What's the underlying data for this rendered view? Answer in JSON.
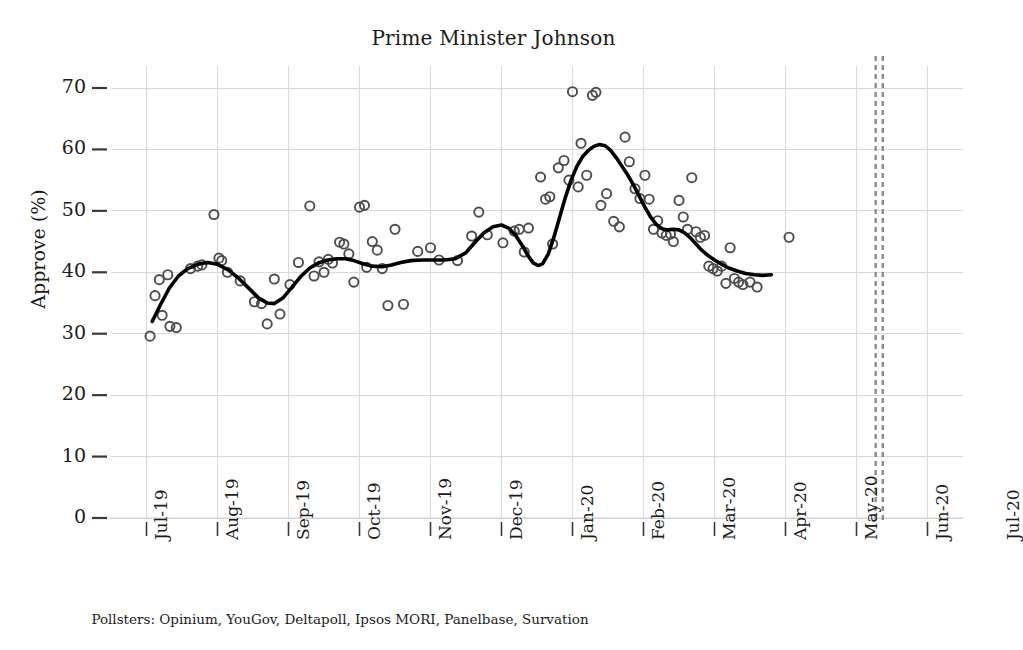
{
  "chart_data": {
    "type": "scatter",
    "title": "Prime Minister Johnson",
    "xlabel": "",
    "ylabel": "Approve (%)",
    "ylim": [
      0,
      73
    ],
    "yticks": [
      0,
      10,
      20,
      30,
      40,
      50,
      60,
      70
    ],
    "ytick_labels": [
      "0",
      "10",
      "20",
      "30",
      "40",
      "50",
      "60",
      "70"
    ],
    "xlim": [
      "2019-07-01",
      "2020-07-15"
    ],
    "xtick_labels": [
      "Jul-19",
      "Aug-19",
      "Sep-19",
      "Oct-19",
      "Nov-19",
      "Dec-19",
      "Jan-20",
      "Feb-20",
      "Mar-20",
      "Apr-20",
      "May-20",
      "Jun-20",
      "Jul-20"
    ],
    "grid": true,
    "legend": null,
    "caption": "Pollsters: Opinium, YouGov, Deltapoll, Ipsos MORI, Panelbase, Survation",
    "marker": "open-circle",
    "marker_color": "#4d4d4d",
    "line_color": "#000000",
    "grid_color": "#d9d9d9",
    "annotations": [
      {
        "type": "vline",
        "style": "dashed",
        "color": "#8c8c8c",
        "x": 11.27,
        "label": ""
      },
      {
        "type": "vline",
        "style": "dashed",
        "color": "#8c8c8c",
        "x": 11.37,
        "label": ""
      }
    ],
    "series": [
      {
        "name": "Poll approval",
        "type": "scatter",
        "points": [
          [
            1.05,
            29.6
          ],
          [
            1.12,
            36.2
          ],
          [
            1.18,
            38.8
          ],
          [
            1.22,
            33.0
          ],
          [
            1.3,
            39.6
          ],
          [
            1.33,
            31.2
          ],
          [
            1.42,
            31.0
          ],
          [
            1.62,
            40.6
          ],
          [
            1.72,
            41.0
          ],
          [
            1.78,
            41.2
          ],
          [
            1.95,
            49.4
          ],
          [
            2.02,
            42.3
          ],
          [
            2.06,
            41.9
          ],
          [
            2.14,
            40.0
          ],
          [
            2.32,
            38.6
          ],
          [
            2.52,
            35.2
          ],
          [
            2.62,
            34.9
          ],
          [
            2.7,
            31.6
          ],
          [
            2.8,
            38.9
          ],
          [
            2.88,
            33.2
          ],
          [
            3.02,
            38.0
          ],
          [
            3.14,
            41.6
          ],
          [
            3.3,
            50.8
          ],
          [
            3.36,
            39.4
          ],
          [
            3.43,
            41.7
          ],
          [
            3.5,
            40.0
          ],
          [
            3.56,
            42.1
          ],
          [
            3.62,
            41.5
          ],
          [
            3.72,
            44.9
          ],
          [
            3.78,
            44.6
          ],
          [
            3.85,
            43.0
          ],
          [
            3.92,
            38.4
          ],
          [
            4.0,
            50.6
          ],
          [
            4.07,
            50.9
          ],
          [
            4.1,
            40.8
          ],
          [
            4.18,
            45.0
          ],
          [
            4.25,
            43.6
          ],
          [
            4.32,
            40.6
          ],
          [
            4.4,
            34.6
          ],
          [
            4.5,
            47.0
          ],
          [
            4.62,
            34.8
          ],
          [
            4.82,
            43.4
          ],
          [
            5.0,
            44.0
          ],
          [
            5.12,
            42.0
          ],
          [
            5.38,
            41.9
          ],
          [
            5.58,
            45.9
          ],
          [
            5.68,
            49.8
          ],
          [
            5.8,
            46.1
          ],
          [
            6.02,
            44.8
          ],
          [
            6.18,
            46.7
          ],
          [
            6.25,
            47.0
          ],
          [
            6.32,
            43.3
          ],
          [
            6.38,
            47.2
          ],
          [
            6.55,
            55.5
          ],
          [
            6.62,
            51.9
          ],
          [
            6.68,
            52.3
          ],
          [
            6.72,
            44.6
          ],
          [
            6.8,
            57.0
          ],
          [
            6.88,
            58.2
          ],
          [
            6.95,
            55.0
          ],
          [
            7.0,
            69.4
          ],
          [
            7.08,
            53.9
          ],
          [
            7.12,
            61.0
          ],
          [
            7.2,
            55.8
          ],
          [
            7.28,
            68.8
          ],
          [
            7.33,
            69.3
          ],
          [
            7.4,
            50.9
          ],
          [
            7.48,
            52.8
          ],
          [
            7.58,
            48.3
          ],
          [
            7.66,
            47.4
          ],
          [
            7.74,
            62.0
          ],
          [
            7.8,
            58.0
          ],
          [
            7.88,
            53.6
          ],
          [
            7.95,
            52.0
          ],
          [
            8.02,
            55.8
          ],
          [
            8.08,
            51.9
          ],
          [
            8.14,
            47.0
          ],
          [
            8.2,
            48.4
          ],
          [
            8.26,
            46.4
          ],
          [
            8.32,
            46.0
          ],
          [
            8.38,
            46.2
          ],
          [
            8.42,
            45.0
          ],
          [
            8.5,
            51.7
          ],
          [
            8.56,
            49.0
          ],
          [
            8.62,
            47.0
          ],
          [
            8.68,
            55.4
          ],
          [
            8.74,
            46.6
          ],
          [
            8.8,
            45.7
          ],
          [
            8.86,
            46.0
          ],
          [
            8.92,
            41.0
          ],
          [
            8.98,
            40.6
          ],
          [
            9.04,
            40.2
          ],
          [
            9.1,
            41.0
          ],
          [
            9.16,
            38.2
          ],
          [
            9.22,
            44.0
          ],
          [
            9.28,
            39.0
          ],
          [
            9.34,
            38.4
          ],
          [
            9.4,
            38.0
          ],
          [
            9.5,
            38.4
          ],
          [
            9.6,
            37.6
          ],
          [
            10.05,
            45.7
          ]
        ]
      },
      {
        "name": "Smoothed trend",
        "type": "line",
        "points": [
          [
            1.08,
            32.0
          ],
          [
            1.2,
            34.8
          ],
          [
            1.32,
            37.4
          ],
          [
            1.45,
            39.4
          ],
          [
            1.58,
            40.6
          ],
          [
            1.72,
            41.3
          ],
          [
            1.86,
            41.6
          ],
          [
            2.0,
            41.3
          ],
          [
            2.15,
            40.4
          ],
          [
            2.3,
            39.0
          ],
          [
            2.45,
            37.3
          ],
          [
            2.58,
            35.8
          ],
          [
            2.7,
            35.0
          ],
          [
            2.8,
            34.9
          ],
          [
            2.92,
            35.8
          ],
          [
            3.05,
            37.6
          ],
          [
            3.18,
            39.4
          ],
          [
            3.3,
            40.7
          ],
          [
            3.42,
            41.5
          ],
          [
            3.55,
            42.0
          ],
          [
            3.68,
            42.2
          ],
          [
            3.8,
            42.2
          ],
          [
            3.92,
            41.9
          ],
          [
            4.05,
            41.4
          ],
          [
            4.18,
            41.0
          ],
          [
            4.32,
            40.9
          ],
          [
            4.45,
            41.2
          ],
          [
            4.58,
            41.6
          ],
          [
            4.72,
            41.9
          ],
          [
            4.88,
            42.0
          ],
          [
            5.05,
            42.0
          ],
          [
            5.2,
            42.0
          ],
          [
            5.35,
            42.2
          ],
          [
            5.5,
            43.2
          ],
          [
            5.62,
            44.8
          ],
          [
            5.75,
            46.4
          ],
          [
            5.88,
            47.4
          ],
          [
            6.0,
            47.7
          ],
          [
            6.1,
            47.2
          ],
          [
            6.2,
            46.0
          ],
          [
            6.3,
            44.2
          ],
          [
            6.38,
            42.6
          ],
          [
            6.45,
            41.5
          ],
          [
            6.52,
            41.1
          ],
          [
            6.58,
            41.4
          ],
          [
            6.66,
            43.0
          ],
          [
            6.74,
            45.8
          ],
          [
            6.82,
            49.0
          ],
          [
            6.9,
            52.2
          ],
          [
            6.98,
            55.0
          ],
          [
            7.06,
            57.2
          ],
          [
            7.14,
            58.8
          ],
          [
            7.22,
            59.8
          ],
          [
            7.3,
            60.5
          ],
          [
            7.38,
            60.8
          ],
          [
            7.46,
            60.6
          ],
          [
            7.54,
            59.8
          ],
          [
            7.62,
            58.6
          ],
          [
            7.7,
            57.2
          ],
          [
            7.78,
            55.8
          ],
          [
            7.86,
            54.2
          ],
          [
            7.94,
            52.4
          ],
          [
            8.02,
            50.6
          ],
          [
            8.1,
            49.0
          ],
          [
            8.18,
            47.8
          ],
          [
            8.26,
            47.1
          ],
          [
            8.34,
            46.9
          ],
          [
            8.42,
            47.0
          ],
          [
            8.5,
            46.9
          ],
          [
            8.58,
            46.4
          ],
          [
            8.66,
            45.6
          ],
          [
            8.74,
            44.6
          ],
          [
            8.82,
            43.6
          ],
          [
            8.9,
            42.8
          ],
          [
            9.0,
            42.0
          ],
          [
            9.1,
            41.3
          ],
          [
            9.2,
            40.7
          ],
          [
            9.32,
            40.2
          ],
          [
            9.44,
            39.8
          ],
          [
            9.56,
            39.6
          ],
          [
            9.68,
            39.5
          ],
          [
            9.8,
            39.6
          ]
        ]
      }
    ]
  }
}
